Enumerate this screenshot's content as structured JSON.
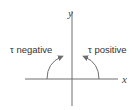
{
  "diagram": {
    "axes": {
      "x_label": "x",
      "y_label": "y"
    },
    "labels": {
      "left": "τ negative",
      "right": "τ positive"
    },
    "arrows": {
      "left": "curved-arrow-counterclockwise-from-negative-x",
      "right": "curved-arrow-clockwise-from-positive-x"
    },
    "colors": {
      "line": "#6e6e6e",
      "text": "#333333"
    }
  }
}
